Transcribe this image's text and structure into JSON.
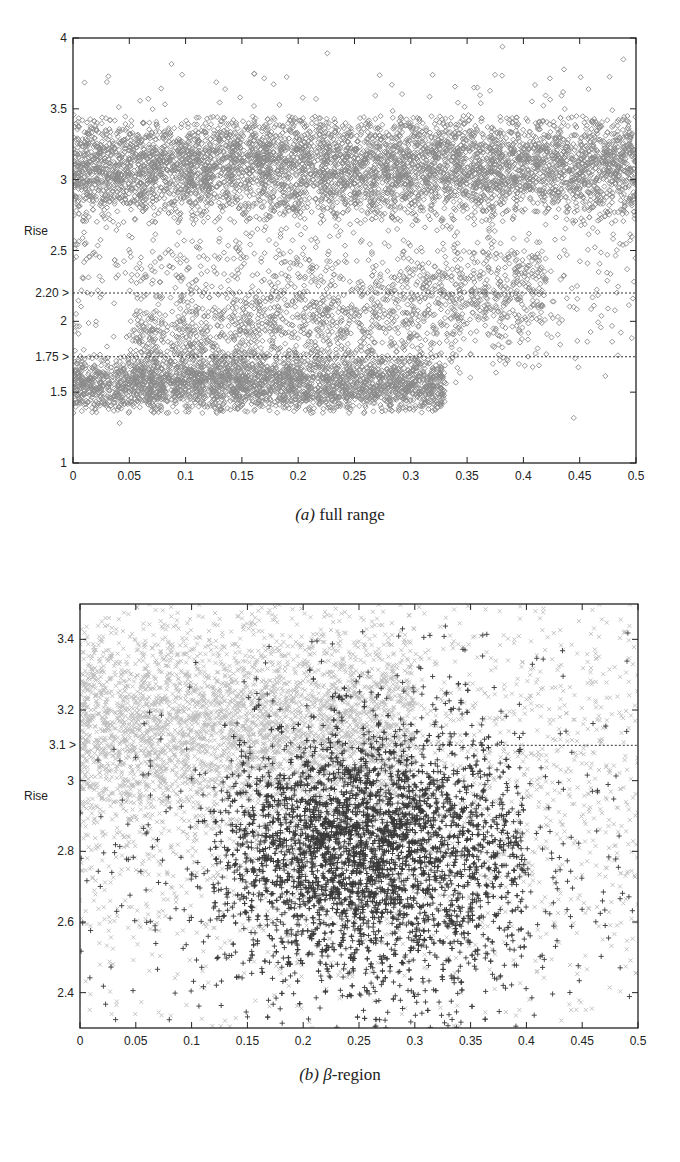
{
  "figures": [
    {
      "id": "a",
      "caption_letter": "(a)",
      "caption_text": " full range"
    },
    {
      "id": "b",
      "caption_letter": "(b)",
      "caption_beta": "β",
      "caption_text": "-region"
    }
  ],
  "chart_data": [
    {
      "type": "scatter",
      "title": "(a) full range",
      "xlabel": "",
      "ylabel": "Rise",
      "xlim": [
        0,
        0.5
      ],
      "ylim": [
        1,
        4
      ],
      "x_ticks": [
        0,
        0.05,
        0.1,
        0.15,
        0.2,
        0.25,
        0.3,
        0.35,
        0.4,
        0.45,
        0.5
      ],
      "x_tick_labels": [
        "0",
        "0.05",
        "0.1",
        "0.15",
        "0.2",
        "0.25",
        "0.3",
        "0.35",
        "0.4",
        "0.45",
        "0.5"
      ],
      "y_ticks": [
        1,
        1.5,
        2,
        2.5,
        3,
        3.5,
        4
      ],
      "y_tick_labels": [
        "1",
        "1.5",
        "2",
        "2.5",
        "3",
        "3.5",
        "4"
      ],
      "grid": false,
      "legend": null,
      "reference_lines": [
        {
          "y": 2.2,
          "label": "2.20 >",
          "style": "dotted",
          "x_from": 0,
          "x_to": 0.5
        },
        {
          "y": 1.75,
          "label": "1.75 >",
          "style": "dotted",
          "x_from": 0,
          "x_to": 0.5
        }
      ],
      "series": [
        {
          "name": "all points",
          "marker": "diamond",
          "color": "#8a8a8a",
          "clusters": [
            {
              "label": "upper band",
              "x_range": [
                0,
                0.5
              ],
              "y_center": 3.1,
              "y_spread": 0.18,
              "y_min": 2.7,
              "y_max": 3.45,
              "count": 5200
            },
            {
              "label": "lower band",
              "x_range": [
                0,
                0.33
              ],
              "y_center": 1.55,
              "y_spread": 0.1,
              "y_min": 1.35,
              "y_max": 1.8,
              "count": 2600
            },
            {
              "label": "lower band rising",
              "x_range": [
                0.05,
                0.42
              ],
              "y_center": 1.95,
              "y_spread": 0.22,
              "y_min": 1.6,
              "y_max": 2.5,
              "count": 1500
            },
            {
              "label": "scattered mid",
              "x_range": [
                0,
                0.5
              ],
              "y_center": 2.4,
              "y_spread": 0.35,
              "y_min": 1.2,
              "y_max": 3.0,
              "count": 700
            },
            {
              "label": "outliers top",
              "x_range": [
                0,
                0.5
              ],
              "y_center": 3.6,
              "y_spread": 0.15,
              "y_min": 3.45,
              "y_max": 3.95,
              "count": 60
            }
          ]
        }
      ]
    },
    {
      "type": "scatter",
      "title": "(b) β-region",
      "xlabel": "",
      "ylabel": "Rise",
      "xlim": [
        0,
        0.5
      ],
      "ylim": [
        2.3,
        3.5
      ],
      "x_ticks": [
        0,
        0.05,
        0.1,
        0.15,
        0.2,
        0.25,
        0.3,
        0.35,
        0.4,
        0.45,
        0.5
      ],
      "x_tick_labels": [
        "0",
        "0.05",
        "0.1",
        "0.15",
        "0.2",
        "0.25",
        "0.3",
        "0.35",
        "0.4",
        "0.45",
        "0.5"
      ],
      "y_ticks": [
        2.4,
        2.6,
        2.8,
        3,
        3.2,
        3.4
      ],
      "y_tick_labels": [
        "2.4",
        "2.6",
        "2.8",
        "3",
        "3.2",
        "3.4"
      ],
      "grid": false,
      "legend": null,
      "reference_lines": [
        {
          "y": 3.1,
          "label": "3.1 >",
          "style": "dotted",
          "x_from": 0.3,
          "x_to": 0.5
        }
      ],
      "series": [
        {
          "name": "background points",
          "marker": "x",
          "color": "#bdbdbd",
          "clusters": [
            {
              "label": "upper-left dense",
              "x_range": [
                0,
                0.3
              ],
              "y_center": 3.15,
              "y_spread": 0.14,
              "y_min": 2.8,
              "y_max": 3.5,
              "count": 3200
            },
            {
              "label": "spread",
              "x_range": [
                0,
                0.5
              ],
              "y_center": 3.0,
              "y_spread": 0.3,
              "y_min": 2.3,
              "y_max": 3.5,
              "count": 2200
            }
          ]
        },
        {
          "name": "beta-region points",
          "marker": "plus",
          "color": "#3a3a3a",
          "clusters": [
            {
              "label": "core",
              "x_range": [
                0.12,
                0.4
              ],
              "x_center": 0.26,
              "x_spread": 0.07,
              "y_center": 2.8,
              "y_spread": 0.17,
              "y_min": 2.3,
              "y_max": 3.45,
              "count": 3800
            },
            {
              "label": "diffuse",
              "x_range": [
                0,
                0.5
              ],
              "x_center": 0.26,
              "x_spread": 0.12,
              "y_center": 2.75,
              "y_spread": 0.28,
              "y_min": 2.3,
              "y_max": 3.45,
              "count": 900
            }
          ]
        }
      ]
    }
  ]
}
